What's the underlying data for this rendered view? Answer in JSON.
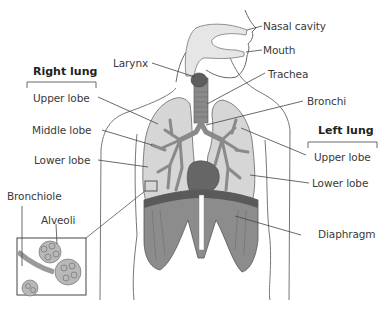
{
  "diagram": {
    "type": "anatomy-labeled-illustration",
    "groups": {
      "right_lung": {
        "title": "Right lung",
        "lobes": [
          "Upper lobe",
          "Middle lobe",
          "Lower lobe"
        ]
      },
      "left_lung": {
        "title": "Left lung",
        "lobes": [
          "Upper lobe",
          "Lower lobe"
        ]
      }
    },
    "labels": {
      "nasal_cavity": "Nasal cavity",
      "mouth": "Mouth",
      "larynx": "Larynx",
      "trachea": "Trachea",
      "bronchi": "Bronchi",
      "diaphragm": "Diaphragm",
      "bronchiole": "Bronchiole",
      "alveoli": "Alveoli"
    },
    "inset": {
      "description": "Magnified view of bronchiole and alveoli",
      "labels": [
        "Bronchiole",
        "Alveoli"
      ]
    },
    "colors": {
      "outline": "#555555",
      "lung_fill": "#d6d6d6",
      "bronchi_fill": "#8a8a8a",
      "airway_fill": "#e6e6e6",
      "larynx_fill": "#5e5e5e",
      "diaphragm_fill": "#8c8c8c",
      "diaphragm_dark": "#5a5a5a",
      "heart_fill": "#666666",
      "alveoli_fill": "#b8b8b8"
    }
  }
}
